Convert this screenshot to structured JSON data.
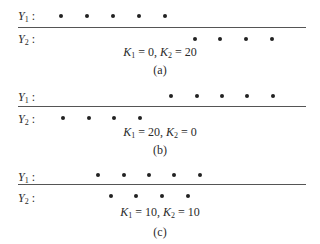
{
  "rows": {
    "y1": "Y",
    "y1_sub": "1",
    "y2": "Y",
    "y2_sub": "2",
    "colon": ":"
  },
  "panels": [
    {
      "caption": "(a)",
      "k1": "0",
      "k2": "20",
      "y1_dots_x": [
        61,
        87,
        113,
        139,
        165
      ],
      "y2_dots_x": [
        195,
        220,
        246,
        272
      ]
    },
    {
      "caption": "(b)",
      "k1": "20",
      "k2": "0",
      "y1_dots_x": [
        171,
        197,
        222,
        247,
        273
      ],
      "y2_dots_x": [
        63,
        89,
        114,
        140
      ]
    },
    {
      "caption": "(c)",
      "k1": "10",
      "k2": "10",
      "y1_dots_x": [
        98,
        124,
        149,
        174,
        200
      ],
      "y2_dots_x": [
        111,
        136,
        162,
        188
      ]
    }
  ],
  "k_label": {
    "k": "K",
    "k1_sub": "1",
    "k2_sub": "2",
    "eq": " = ",
    "sep": ", "
  }
}
